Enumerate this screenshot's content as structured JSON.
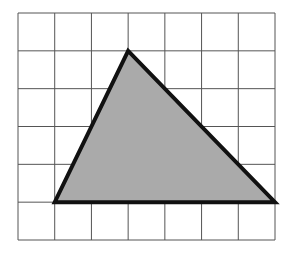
{
  "figure": {
    "grid": {
      "columns": 7,
      "rows": 6,
      "left": 18,
      "top": 13,
      "right": 275,
      "bottom": 240,
      "line_color": "#555555"
    },
    "triangle": {
      "vertices_grid": [
        [
          3,
          1
        ],
        [
          1,
          5
        ],
        [
          7,
          5
        ]
      ],
      "fill": "#aaaaaa",
      "stroke": "#111111",
      "stroke_width": 4
    }
  }
}
